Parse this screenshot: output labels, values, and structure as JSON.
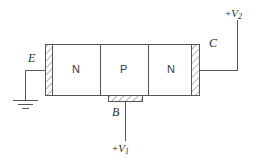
{
  "figure": {
    "kind": "npn-transistor-cross-section",
    "stroke_color": "#555555",
    "hatch_color": "#777777",
    "text_color": "#2b2b2b",
    "background": "#ffffff"
  },
  "regions": [
    {
      "id": "emitter-region",
      "label": "N"
    },
    {
      "id": "base-region",
      "label": "P"
    },
    {
      "id": "collector-region",
      "label": "N"
    }
  ],
  "terminals": {
    "emitter": {
      "label": "E",
      "name": "emitter-terminal"
    },
    "base": {
      "label": "B",
      "name": "base-terminal"
    },
    "collector": {
      "label": "C",
      "name": "collector-terminal"
    }
  },
  "supplies": {
    "base_supply": {
      "sign": "+",
      "symbol": "V",
      "subscript": "1",
      "full": "+V1"
    },
    "collector_supply": {
      "sign": "+",
      "symbol": "V",
      "subscript": "2",
      "full": "+V2"
    }
  },
  "ground": {
    "label": "",
    "name": "ground-symbol"
  }
}
